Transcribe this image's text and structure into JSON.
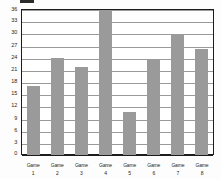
{
  "chart_data": {
    "type": "bar",
    "title": "",
    "subtitle": "",
    "xlabel": "",
    "ylabel": "",
    "categories": [
      "Game 1",
      "Game 2",
      "Game 3",
      "Game 4",
      "Game 5",
      "Game 6",
      "Game 7",
      "Game 8"
    ],
    "category_lines": [
      [
        "Game",
        "1"
      ],
      [
        "Game",
        "2"
      ],
      [
        "Game",
        "3"
      ],
      [
        "Game",
        "4"
      ],
      [
        "Game",
        "5"
      ],
      [
        "Game",
        "6"
      ],
      [
        "Game",
        "7"
      ],
      [
        "Game",
        "8"
      ]
    ],
    "values": [
      17.0,
      23.9,
      21.8,
      35.7,
      10.7,
      23.5,
      29.6,
      26.2
    ],
    "ylim": [
      0,
      36
    ],
    "ytick_step": 3,
    "yticks": [
      0,
      3,
      6,
      9,
      12,
      15,
      18,
      21,
      24,
      27,
      30,
      33,
      36
    ],
    "ytick_labels": [
      "0",
      "3",
      "6",
      "9",
      "12",
      "15",
      "18",
      "21",
      "24",
      "27",
      "30",
      "33",
      "36"
    ],
    "grid": true,
    "grid_axis": "y",
    "legend": false,
    "legend_position": "none",
    "bar_color": "#9a9a9a",
    "grid_color": "#9a9a9a",
    "axis_color": "#1c1c1c",
    "background_color": "#ffffff"
  },
  "artifact": {
    "name": "clipped-top-marker",
    "color": "#2b2b2b"
  }
}
